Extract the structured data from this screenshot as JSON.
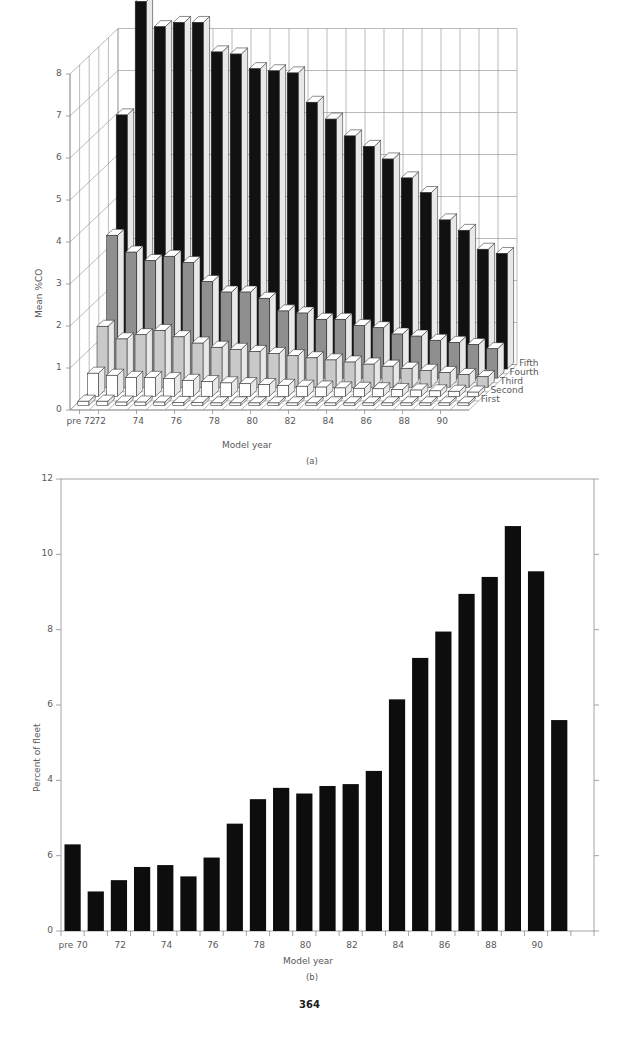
{
  "page": {
    "folio": "364",
    "figure_a_caption": "(a)",
    "figure_b_caption": "(b)"
  },
  "figure_a": {
    "name": "mean-co-by-model-year-and-quintile",
    "ylabel": "Mean %CO",
    "xlabel": "Model year",
    "yticks": [
      "0",
      "1",
      "2",
      "3",
      "4",
      "5",
      "6",
      "7",
      "8"
    ],
    "xticks": [
      "pre 72",
      "72",
      "74",
      "76",
      "78",
      "80",
      "82",
      "84",
      "86",
      "88",
      "90"
    ],
    "series_labels": [
      "First",
      "Second",
      "Third",
      "Fourth",
      "Fifth"
    ]
  },
  "figure_b": {
    "name": "percent-of-fleet-by-model-year",
    "ylabel": "Percent of fleet",
    "xlabel": "Model year",
    "yticks": [
      "0",
      "6",
      "4",
      "6",
      "8",
      "10",
      "12"
    ],
    "xticks": [
      "pre 70",
      "72",
      "74",
      "76",
      "78",
      "80",
      "82",
      "84",
      "86",
      "88",
      "90"
    ]
  },
  "chart_data": [
    {
      "type": "bar",
      "name": "figure-a",
      "title": "",
      "subtitle": "(a)",
      "projection": "3d",
      "xlabel": "Model year",
      "ylabel": "Mean %CO",
      "zlabel": "",
      "ylim": [
        0,
        8
      ],
      "grid": true,
      "legend_position": "right-depth-axis",
      "categories": [
        "pre 72",
        "72",
        "73",
        "74",
        "75",
        "76",
        "77",
        "78",
        "79",
        "80",
        "81",
        "82",
        "83",
        "84",
        "85",
        "86",
        "87",
        "88",
        "89",
        "90",
        "91"
      ],
      "depth_categories": [
        "First",
        "Second",
        "Third",
        "Fourth",
        "Fifth"
      ],
      "series": [
        {
          "name": "First",
          "values": [
            0.1,
            0.1,
            0.08,
            0.08,
            0.08,
            0.07,
            0.07,
            0.06,
            0.06,
            0.06,
            0.05,
            0.05,
            0.05,
            0.04,
            0.04,
            0.04,
            0.03,
            0.03,
            0.03,
            0.02,
            0.02
          ]
        },
        {
          "name": "Second",
          "values": [
            0.55,
            0.5,
            0.45,
            0.45,
            0.42,
            0.38,
            0.35,
            0.32,
            0.3,
            0.28,
            0.26,
            0.24,
            0.22,
            0.2,
            0.19,
            0.18,
            0.16,
            0.15,
            0.13,
            0.12,
            0.1
          ]
        },
        {
          "name": "Third",
          "values": [
            1.45,
            1.15,
            1.25,
            1.35,
            1.2,
            1.05,
            0.95,
            0.9,
            0.85,
            0.8,
            0.75,
            0.7,
            0.65,
            0.6,
            0.55,
            0.5,
            0.45,
            0.4,
            0.35,
            0.3,
            0.25
          ]
        },
        {
          "name": "Fourth",
          "values": [
            3.4,
            3.0,
            2.8,
            2.9,
            2.75,
            2.3,
            2.05,
            2.05,
            1.9,
            1.6,
            1.55,
            1.4,
            1.4,
            1.25,
            1.2,
            1.05,
            1.0,
            0.9,
            0.85,
            0.8,
            0.7
          ]
        },
        {
          "name": "Fifth",
          "values": [
            6.05,
            8.75,
            8.15,
            8.25,
            8.25,
            7.55,
            7.5,
            7.15,
            7.1,
            7.05,
            6.35,
            5.95,
            5.55,
            5.3,
            5.0,
            4.55,
            4.2,
            3.55,
            3.3,
            2.85,
            2.75
          ]
        }
      ]
    },
    {
      "type": "bar",
      "name": "figure-b",
      "title": "",
      "subtitle": "(b)",
      "xlabel": "Model year",
      "ylabel": "Percent of fleet",
      "ylim": [
        0,
        12
      ],
      "ytick_values": [
        0,
        2,
        4,
        6,
        8,
        10,
        12
      ],
      "ytick_labels": [
        "0",
        "6",
        "4",
        "6",
        "8",
        "10",
        "12"
      ],
      "grid": false,
      "categories": [
        "pre 70",
        "70",
        "71",
        "72",
        "73",
        "74",
        "75",
        "76",
        "77",
        "78",
        "79",
        "80",
        "81",
        "82",
        "83",
        "84",
        "85",
        "86",
        "87",
        "88",
        "89",
        "90",
        "91"
      ],
      "values": [
        2.3,
        1.05,
        1.35,
        1.7,
        1.75,
        1.45,
        1.95,
        2.85,
        3.5,
        3.8,
        3.65,
        3.85,
        3.9,
        4.25,
        6.15,
        7.25,
        7.95,
        8.95,
        9.4,
        10.75,
        9.55,
        5.6,
        0
      ]
    }
  ]
}
